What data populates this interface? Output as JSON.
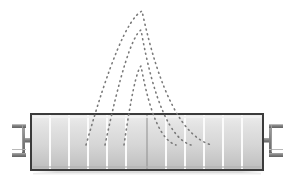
{
  "figure": {
    "canvas": {
      "width": 288,
      "height": 180,
      "background": "#ffffff"
    }
  },
  "colors": {
    "outline": "#3b3b3b",
    "body_light": "#e8e8e8",
    "body_mid": "#d2d2d2",
    "body_dark": "#b9b9b9",
    "segment_line": "#fbfbfb",
    "center_line": "#8e8e8e",
    "bracket": "#6e6e6e",
    "bracket_light": "#a6a6a6",
    "arc_dots": "#7a7a7a",
    "shadow": "#cfcfcf"
  },
  "beam": {
    "name": "segmented-beam-body",
    "x": 31,
    "y": 114,
    "width": 232,
    "height": 56,
    "stroke_width": 2,
    "segment_count": 12,
    "segment_divider_x": [
      50,
      69,
      88,
      107,
      126,
      147,
      166,
      185,
      204,
      223,
      242
    ],
    "center_divider_x": 147,
    "center_divider_color": "#8e8e8e"
  },
  "brackets": [
    {
      "name": "left-end-anchor",
      "side": "left",
      "stem_x": 22,
      "stem_y": 140,
      "stem_length": 9,
      "flange_x": 12,
      "flange_top_y": 124,
      "flange_bottom_y": 153,
      "flange_width": 14,
      "flange_thickness": 4,
      "web_thickness": 3
    },
    {
      "name": "right-end-anchor",
      "side": "right",
      "stem_x": 263,
      "stem_y": 140,
      "stem_length": 9,
      "flange_x": 276,
      "flange_top_y": 124,
      "flange_bottom_y": 153,
      "flange_width": 14,
      "flange_thickness": 4,
      "web_thickness": 3
    }
  ],
  "arcs": [
    {
      "name": "arc-outer-tall",
      "label": "outer arc",
      "left_end": {
        "x": 86,
        "y": 145
      },
      "peak": {
        "x": 142,
        "y": 11
      },
      "right_end": {
        "x": 212,
        "y": 145
      },
      "dash": "1 4",
      "stroke_width": 1.6
    },
    {
      "name": "arc-middle",
      "label": "middle arc",
      "left_end": {
        "x": 105,
        "y": 145
      },
      "peak": {
        "x": 141,
        "y": 30
      },
      "right_end": {
        "x": 191,
        "y": 145
      },
      "dash": "1 4",
      "stroke_width": 1.6
    },
    {
      "name": "arc-inner-low",
      "label": "inner arc",
      "left_end": {
        "x": 124,
        "y": 145
      },
      "peak": {
        "x": 141,
        "y": 66
      },
      "right_end": {
        "x": 176,
        "y": 145
      },
      "dash": "1 4",
      "stroke_width": 1.6
    }
  ],
  "shadow": {
    "name": "ground-shadow",
    "x": 33,
    "y": 170,
    "width": 232,
    "height": 3
  }
}
